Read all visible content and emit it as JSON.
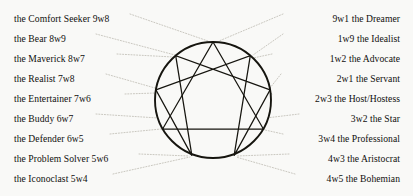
{
  "diagram": {
    "background_color": "#f9f9f7",
    "line_color": "#16150f",
    "leader_color": "#b9b7ae",
    "text_color": "#100f0d"
  },
  "left_labels": [
    {
      "text": "the Comfort Seeker 9w8",
      "y": 13
    },
    {
      "text": "the Bear 8w9",
      "y": 33
    },
    {
      "text": "the Maverick 8w7",
      "y": 53
    },
    {
      "text": "the Realist 7w8",
      "y": 73
    },
    {
      "text": "the Entertainer 7w6",
      "y": 93
    },
    {
      "text": "the Buddy 6w7",
      "y": 113
    },
    {
      "text": "the Defender 6w5",
      "y": 133
    },
    {
      "text": "the Problem Solver 5w6",
      "y": 153
    },
    {
      "text": "the Iconoclast 5w4",
      "y": 173
    }
  ],
  "right_labels": [
    {
      "text": "9w1 the Dreamer",
      "y": 13
    },
    {
      "text": "1w9 the Idealist",
      "y": 33
    },
    {
      "text": "1w2 the Advocate",
      "y": 53
    },
    {
      "text": "2w1 the Servant",
      "y": 73
    },
    {
      "text": "2w3 the Host/Hostess",
      "y": 93
    },
    {
      "text": "3w2 the Star",
      "y": 113
    },
    {
      "text": "3w4 the Professional",
      "y": 133
    },
    {
      "text": "4w3 the Aristocrat",
      "y": 153
    },
    {
      "text": "4w5 the Bohemian",
      "y": 173
    }
  ],
  "figure": {
    "center_x": 213,
    "center_y": 100,
    "radius": 58,
    "points": [
      {
        "id": "9",
        "x": 213.0,
        "y": 42.0
      },
      {
        "id": "1",
        "x": 250.3,
        "y": 55.6
      },
      {
        "id": "2",
        "x": 270.1,
        "y": 89.9
      },
      {
        "id": "3",
        "x": 263.4,
        "y": 129.0
      },
      {
        "id": "4",
        "x": 234.1,
        "y": 155.6
      },
      {
        "id": "5",
        "x": 191.9,
        "y": 155.6
      },
      {
        "id": "6",
        "x": 162.6,
        "y": 129.0
      },
      {
        "id": "7",
        "x": 155.9,
        "y": 89.9
      },
      {
        "id": "8",
        "x": 175.7,
        "y": 55.6
      }
    ],
    "triangle_path": "9-3-6-9",
    "hexad_path": "1-4-2-8-5-7-1"
  }
}
